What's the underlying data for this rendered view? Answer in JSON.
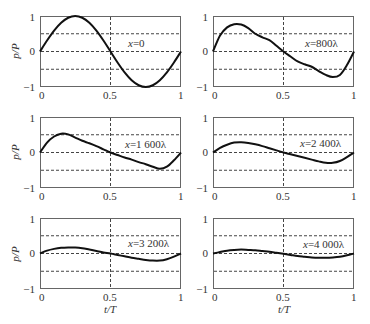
{
  "chart_data": {
    "type": "line",
    "title": "",
    "layout": "3 rows x 2 columns subplots",
    "xlabel": "t/T",
    "ylabel": "p/P",
    "xlim": [
      0,
      1
    ],
    "ylim": [
      -1,
      1
    ],
    "xtick_labels": [
      "0",
      "0.5",
      "1"
    ],
    "ytick_labels": [
      "1",
      "0",
      "−1"
    ],
    "grid": {
      "horizontal": [
        0.5,
        0,
        -0.5
      ],
      "vertical": [
        0.5
      ],
      "style": "dashed"
    },
    "t": [
      0,
      0.05,
      0.1,
      0.15,
      0.2,
      0.25,
      0.3,
      0.35,
      0.4,
      0.45,
      0.5,
      0.55,
      0.6,
      0.65,
      0.7,
      0.75,
      0.8,
      0.85,
      0.9,
      0.95,
      1
    ],
    "series": [
      {
        "name": "x=0",
        "label_var": "x",
        "label_rest": "=0",
        "values": [
          0,
          0.309,
          0.588,
          0.809,
          0.951,
          1,
          0.951,
          0.809,
          0.588,
          0.309,
          0,
          -0.309,
          -0.588,
          -0.809,
          -0.951,
          -1,
          -0.951,
          -0.809,
          -0.588,
          -0.309,
          0
        ]
      },
      {
        "name": "x=800λ",
        "label_var": "x",
        "label_rest": "=800λ",
        "values": [
          0,
          0.45,
          0.68,
          0.77,
          0.76,
          0.66,
          0.5,
          0.4,
          0.32,
          0.16,
          0,
          -0.14,
          -0.28,
          -0.36,
          -0.43,
          -0.55,
          -0.66,
          -0.72,
          -0.66,
          -0.38,
          0
        ]
      },
      {
        "name": "x=1 600λ",
        "label_var": "x",
        "label_rest": "=1 600λ",
        "values": [
          0,
          0.28,
          0.45,
          0.53,
          0.51,
          0.42,
          0.33,
          0.26,
          0.18,
          0.09,
          0,
          -0.07,
          -0.14,
          -0.2,
          -0.27,
          -0.33,
          -0.4,
          -0.46,
          -0.4,
          -0.22,
          0
        ]
      },
      {
        "name": "x=2 400λ",
        "label_var": "x",
        "label_rest": "=2 400λ",
        "values": [
          0,
          0.13,
          0.22,
          0.28,
          0.29,
          0.27,
          0.23,
          0.18,
          0.12,
          0.06,
          0,
          -0.05,
          -0.1,
          -0.15,
          -0.2,
          -0.25,
          -0.29,
          -0.29,
          -0.24,
          -0.13,
          0
        ]
      },
      {
        "name": "x=3 200λ",
        "label_var": "x",
        "label_rest": "=3 200λ",
        "values": [
          0,
          0.08,
          0.13,
          0.16,
          0.17,
          0.17,
          0.15,
          0.11,
          0.07,
          0.03,
          0,
          -0.04,
          -0.08,
          -0.12,
          -0.15,
          -0.18,
          -0.2,
          -0.2,
          -0.16,
          -0.09,
          0
        ]
      },
      {
        "name": "x=4 000λ",
        "label_var": "x",
        "label_rest": "=4 000λ",
        "values": [
          0,
          0.04,
          0.08,
          0.1,
          0.11,
          0.1,
          0.09,
          0.07,
          0.05,
          0.02,
          -0.01,
          -0.04,
          -0.07,
          -0.09,
          -0.11,
          -0.12,
          -0.12,
          -0.11,
          -0.09,
          -0.05,
          0
        ]
      }
    ],
    "colors": {
      "curve": "#111111",
      "grid": "#444444",
      "frame": "#666666",
      "text": "#333333"
    }
  }
}
